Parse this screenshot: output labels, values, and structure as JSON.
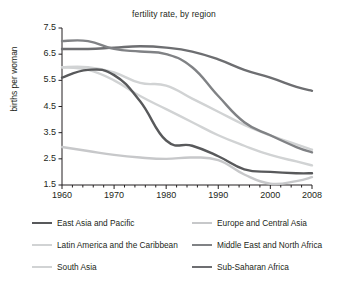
{
  "chart_data": {
    "type": "line",
    "title": "fertility rate, by region",
    "xlabel": "",
    "ylabel": "births per woman",
    "xlim": [
      1960,
      2008
    ],
    "ylim": [
      1.5,
      7.5
    ],
    "xticks": [
      "1960",
      "1970",
      "1980",
      "1990",
      "2000",
      "2008"
    ],
    "xtick_values": [
      1960,
      1970,
      1980,
      1990,
      2000,
      2008
    ],
    "yticks": [
      "1.5",
      "2.5",
      "3.5",
      "4.5",
      "5.5",
      "6.5",
      "7.5"
    ],
    "ytick_values": [
      1.5,
      2.5,
      3.5,
      4.5,
      5.5,
      6.5,
      7.5
    ],
    "grid": false,
    "legend_position": "below",
    "x": [
      1960,
      1965,
      1970,
      1975,
      1980,
      1985,
      1990,
      1995,
      2000,
      2005,
      2008
    ],
    "series": [
      {
        "name": "East Asia and Pacific",
        "color": "#58595b",
        "values": [
          5.6,
          5.9,
          5.7,
          4.7,
          3.2,
          3.0,
          2.6,
          2.1,
          2.0,
          1.95,
          1.95
        ]
      },
      {
        "name": "Europe and Central Asia",
        "color": "#c7c8ca",
        "values": [
          2.95,
          2.8,
          2.65,
          2.55,
          2.5,
          2.55,
          2.45,
          1.9,
          1.55,
          1.65,
          1.8
        ]
      },
      {
        "name": "Latin America and the Caribbean",
        "color": "#d1d3d4",
        "values": [
          6.0,
          5.9,
          5.5,
          4.9,
          4.4,
          3.9,
          3.4,
          3.0,
          2.65,
          2.4,
          2.25
        ]
      },
      {
        "name": "Middle East and North Africa",
        "color": "#808285",
        "values": [
          7.0,
          7.0,
          6.7,
          6.6,
          6.5,
          6.0,
          4.9,
          3.9,
          3.4,
          2.95,
          2.75
        ]
      },
      {
        "name": "South Asia",
        "color": "#d1d3d4",
        "values": [
          6.0,
          6.0,
          5.8,
          5.4,
          5.3,
          4.8,
          4.3,
          3.8,
          3.4,
          3.05,
          2.85
        ]
      },
      {
        "name": "Sub-Saharan Africa",
        "color": "#6d6e71",
        "values": [
          6.7,
          6.7,
          6.75,
          6.8,
          6.75,
          6.6,
          6.3,
          5.9,
          5.6,
          5.25,
          5.1
        ]
      }
    ]
  },
  "legend": {
    "rows": [
      {
        "left": "East Asia and Pacific",
        "right": "Europe and Central Asia"
      },
      {
        "left": "Latin America and the Caribbean",
        "right": "Middle East and North Africa"
      },
      {
        "left": "South Asia",
        "right": "Sub-Saharan Africa"
      }
    ]
  }
}
